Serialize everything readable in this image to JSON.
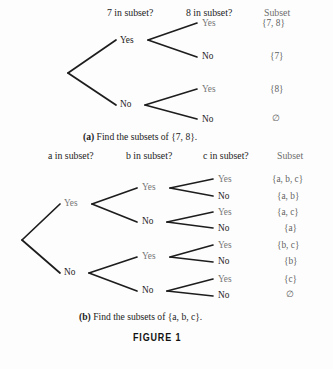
{
  "figure": {
    "label": "FIGURE  1",
    "background_color": "#fdfdfd",
    "line_color": "#1d1d1d"
  },
  "panel_a": {
    "caption_prefix": "(a)",
    "caption_text": " Find the subsets of {7, 8}.",
    "headers": [
      {
        "text": "7 in subset?",
        "x": 107,
        "y": 8
      },
      {
        "text": "8 in subset?",
        "x": 186,
        "y": 8
      },
      {
        "text": "Subset",
        "x": 264,
        "y": 8,
        "faded": true
      }
    ],
    "level1_nodes": [
      {
        "label": "Yes",
        "x": 120,
        "y": 36
      },
      {
        "label": "No",
        "x": 120,
        "y": 100
      }
    ],
    "level2_nodes": [
      {
        "label": "Yes",
        "x": 202,
        "y": 19
      },
      {
        "label": "No",
        "x": 202,
        "y": 52
      },
      {
        "label": "Yes",
        "x": 202,
        "y": 85
      },
      {
        "label": "No",
        "x": 202,
        "y": 115
      }
    ],
    "subsets": [
      {
        "text": "{7, 8}",
        "x": 262,
        "y": 19
      },
      {
        "text": "{7}",
        "x": 270,
        "y": 52
      },
      {
        "text": "{8}",
        "x": 270,
        "y": 85
      },
      {
        "text": "∅",
        "x": 272,
        "y": 114
      }
    ]
  },
  "panel_b": {
    "caption_prefix": "(b)",
    "caption_text": " Find the subsets of {a, b, c}.",
    "headers": [
      {
        "text": "a in subset?",
        "x": 48,
        "y": 151
      },
      {
        "text": "b in subset?",
        "x": 126,
        "y": 151
      },
      {
        "text": "c in subset?",
        "x": 203,
        "y": 151
      },
      {
        "text": "Subset",
        "x": 277,
        "y": 151,
        "faded": true
      }
    ],
    "level1_nodes": [
      {
        "label": "Yes",
        "x": 64,
        "y": 199
      },
      {
        "label": "No",
        "x": 64,
        "y": 268
      }
    ],
    "level2_nodes": [
      {
        "label": "Yes",
        "x": 142,
        "y": 183
      },
      {
        "label": "No",
        "x": 142,
        "y": 217
      },
      {
        "label": "Yes",
        "x": 142,
        "y": 252
      },
      {
        "label": "No",
        "x": 142,
        "y": 286
      }
    ],
    "level3_nodes": [
      {
        "label": "Yes",
        "x": 218,
        "y": 175
      },
      {
        "label": "No",
        "x": 218,
        "y": 192
      },
      {
        "label": "Yes",
        "x": 218,
        "y": 208
      },
      {
        "label": "No",
        "x": 218,
        "y": 224
      },
      {
        "label": "Yes",
        "x": 218,
        "y": 241
      },
      {
        "label": "No",
        "x": 218,
        "y": 257
      },
      {
        "label": "Yes",
        "x": 218,
        "y": 275
      },
      {
        "label": "No",
        "x": 218,
        "y": 291
      }
    ],
    "subsets": [
      {
        "text": "{a, b, c}",
        "x": 272,
        "y": 175
      },
      {
        "text": "{a, b}",
        "x": 277,
        "y": 192
      },
      {
        "text": "{a, c}",
        "x": 277,
        "y": 208
      },
      {
        "text": "{a}",
        "x": 284,
        "y": 224
      },
      {
        "text": "{b, c}",
        "x": 277,
        "y": 241
      },
      {
        "text": "{b}",
        "x": 284,
        "y": 257
      },
      {
        "text": "{c}",
        "x": 284,
        "y": 275
      },
      {
        "text": "∅",
        "x": 286,
        "y": 290
      }
    ]
  }
}
